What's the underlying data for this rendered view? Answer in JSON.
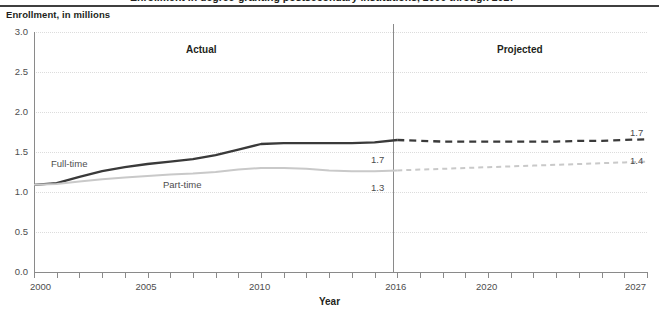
{
  "document": {
    "title_partial": "Enrollment in degree-granting postsecondary institutions, 2000 through 2027"
  },
  "chart_data": {
    "type": "line",
    "title": "",
    "ylabel": "Enrollment, in millions",
    "xlabel": "Year",
    "ylim": [
      0.0,
      3.0
    ],
    "xlim": [
      2000,
      2027
    ],
    "grid": true,
    "legend_position": "inline-labels",
    "y_ticks": [
      "0.0",
      "0.5",
      "1.0",
      "1.5",
      "2.0",
      "2.5",
      "3.0"
    ],
    "y_tick_values": [
      0.0,
      0.5,
      1.0,
      1.5,
      2.0,
      2.5,
      3.0
    ],
    "x_ticks": [
      "2000",
      "2005",
      "2010",
      "2016",
      "2020",
      "2027"
    ],
    "x_tick_values": [
      2000,
      2005,
      2010,
      2016,
      2020,
      2027
    ],
    "x_minor_tick_interval": 1,
    "regions": [
      {
        "label": "Actual",
        "start": 2000,
        "end": 2016
      },
      {
        "label": "Projected",
        "start": 2016,
        "end": 2027
      }
    ],
    "divider_year": 2016,
    "x": [
      2000,
      2001,
      2002,
      2003,
      2004,
      2005,
      2006,
      2007,
      2008,
      2009,
      2010,
      2011,
      2012,
      2013,
      2014,
      2015,
      2016,
      2017,
      2018,
      2019,
      2020,
      2021,
      2022,
      2023,
      2024,
      2025,
      2026,
      2027
    ],
    "series": [
      {
        "name": "Full-time",
        "color": "#3a3a3a",
        "style_actual": "solid",
        "style_projected": "dashed",
        "label_text": "Full-time",
        "values": [
          1.09,
          1.11,
          1.19,
          1.26,
          1.31,
          1.35,
          1.38,
          1.41,
          1.46,
          1.53,
          1.6,
          1.61,
          1.61,
          1.61,
          1.61,
          1.62,
          1.65,
          1.64,
          1.63,
          1.63,
          1.63,
          1.63,
          1.63,
          1.63,
          1.64,
          1.64,
          1.65,
          1.66
        ],
        "divider_value_label": "1.7",
        "end_value_label": "1.7"
      },
      {
        "name": "Part-time",
        "color": "#c9c9c9",
        "style_actual": "solid",
        "style_projected": "dashed",
        "label_text": "Part-time",
        "values": [
          1.09,
          1.1,
          1.13,
          1.16,
          1.18,
          1.2,
          1.22,
          1.23,
          1.25,
          1.28,
          1.3,
          1.3,
          1.29,
          1.27,
          1.26,
          1.26,
          1.27,
          1.28,
          1.29,
          1.3,
          1.31,
          1.32,
          1.33,
          1.34,
          1.35,
          1.36,
          1.37,
          1.38
        ],
        "divider_value_label": "1.3",
        "end_value_label": "1.4"
      }
    ],
    "annotations": [
      {
        "text": "Full-time",
        "kind": "series-label"
      },
      {
        "text": "Part-time",
        "kind": "series-label"
      },
      {
        "text": "1.7",
        "kind": "divider-value"
      },
      {
        "text": "1.3",
        "kind": "divider-value"
      },
      {
        "text": "1.7",
        "kind": "end-value"
      },
      {
        "text": "1.4",
        "kind": "end-value"
      }
    ]
  }
}
